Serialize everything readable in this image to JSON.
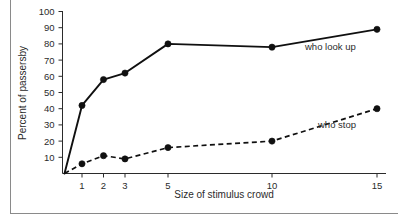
{
  "chart_data": {
    "type": "line",
    "title": "",
    "xlabel": "Size of stimulus crowd",
    "ylabel": "Percent of passersby",
    "categories": [
      "1",
      "2",
      "3",
      "5",
      "10",
      "15"
    ],
    "x": [
      1,
      2,
      3,
      5,
      10,
      15
    ],
    "xtick_labels": [
      "1",
      "2",
      "3",
      "5",
      "10",
      "15"
    ],
    "ytick_labels": [
      "10",
      "20",
      "30",
      "40",
      "50",
      "60",
      "70",
      "80",
      "90",
      "100"
    ],
    "yticks": [
      10,
      20,
      30,
      40,
      50,
      60,
      70,
      80,
      90,
      100
    ],
    "ylim": [
      0,
      100
    ],
    "grid": false,
    "legend_position": "inline-right-of-series",
    "series": [
      {
        "name": "who look up",
        "style": "solid",
        "marker": "filled-circle",
        "origin_value": 0,
        "values": [
          42,
          58,
          62,
          80,
          78,
          89
        ],
        "label": "who look up"
      },
      {
        "name": "who stop",
        "style": "dashed",
        "marker": "filled-circle",
        "origin_value": 0,
        "values": [
          6,
          11,
          9,
          16,
          20,
          40
        ],
        "label": "who stop"
      }
    ],
    "annotations": [
      {
        "text": "who look up",
        "near_x": 15
      },
      {
        "text": "who stop",
        "near_x": 15
      }
    ]
  },
  "colors": {
    "line": "#101010",
    "axis": "#2b2b2b",
    "text": "#2b2b2b",
    "frame": "#8a8a8a",
    "background": "#ffffff"
  }
}
